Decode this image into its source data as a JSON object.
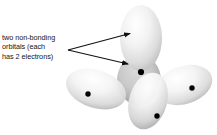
{
  "figure": {
    "type": "orbital-diagram",
    "title_visible": false,
    "background_color": "#ffffff",
    "annotation": {
      "lines": [
        "two non-bonding",
        "orbitals (each",
        "has 2 electrons)"
      ],
      "full_text": "two non-bonding orbitals (each has 2 electrons)",
      "text_color": "#141414",
      "pointer_count": 2,
      "pointer_origin": {
        "x": 68,
        "y": 50
      },
      "pointer_targets": [
        {
          "x": 133,
          "y": 33,
          "label": "top-lobe"
        },
        {
          "x": 131,
          "y": 65,
          "label": "back-lobe"
        }
      ]
    },
    "center_atom": {
      "x": 141,
      "y": 72,
      "dot_color": "#000000"
    },
    "lobes": [
      {
        "name": "top-lobe",
        "role": "non-bonding-orbital",
        "cx": 141,
        "cy": 38,
        "rx": 21,
        "ry": 33,
        "rotation": 0,
        "fill_light": "#fdfdfd",
        "fill_dark": "#bfbfbf",
        "electron_dot": null
      },
      {
        "name": "back-lobe",
        "role": "non-bonding-orbital",
        "cx": 139,
        "cy": 80,
        "rx": 22,
        "ry": 25,
        "rotation": 0,
        "fill_light": "#c9c9c9",
        "fill_dark": "#9a9a9a",
        "electron_dot": null
      },
      {
        "name": "left-lobe",
        "role": "bonding-orbital",
        "cx": 96,
        "cy": 89,
        "rx": 31,
        "ry": 19,
        "rotation": 18,
        "fill_light": "#fbfbfb",
        "fill_dark": "#b4b4b4",
        "electron_dot": {
          "x": 88,
          "y": 94
        }
      },
      {
        "name": "right-lobe",
        "role": "bonding-orbital",
        "cx": 184,
        "cy": 85,
        "rx": 29,
        "ry": 19,
        "rotation": -18,
        "fill_light": "#fbfbfb",
        "fill_dark": "#b4b4b4",
        "electron_dot": {
          "x": 192,
          "y": 88
        }
      },
      {
        "name": "bottom-lobe",
        "role": "bonding-orbital",
        "cx": 148,
        "cy": 101,
        "rx": 19,
        "ry": 29,
        "rotation": 16,
        "fill_light": "#fcfcfc",
        "fill_dark": "#b0b0b0",
        "electron_dot": {
          "x": 157,
          "y": 116
        }
      }
    ],
    "electron_dots": [
      {
        "name": "electron-dot-center",
        "x": 141,
        "y": 72
      },
      {
        "name": "electron-dot-left",
        "x": 88,
        "y": 94
      },
      {
        "name": "electron-dot-right",
        "x": 192,
        "y": 88
      },
      {
        "name": "electron-dot-bottom",
        "x": 157,
        "y": 116
      }
    ]
  }
}
